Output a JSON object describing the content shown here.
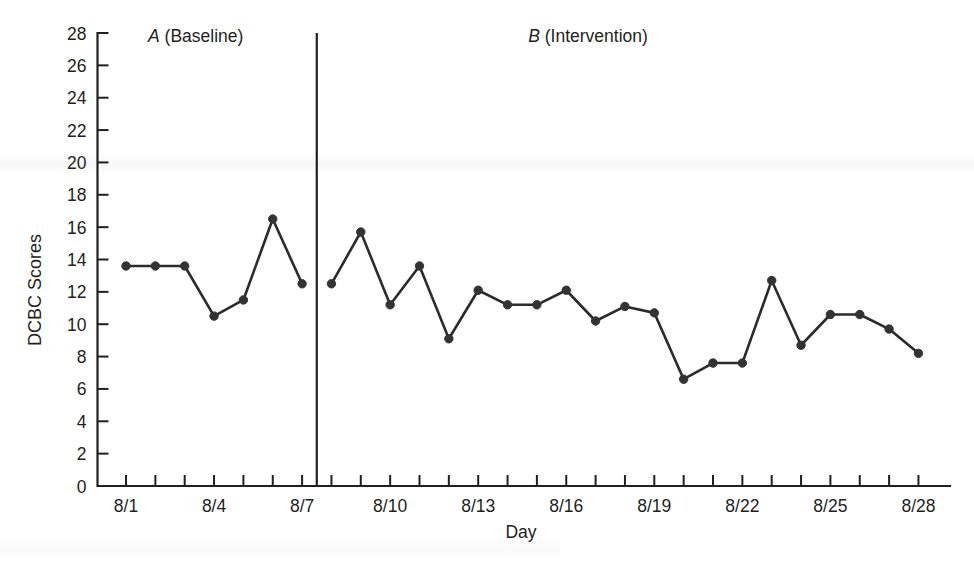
{
  "chart_data": {
    "type": "line",
    "title": "",
    "xlabel": "Day",
    "ylabel": "DCBC Scores",
    "ylim": [
      0,
      28
    ],
    "ytick_step": 2,
    "ytick_labels": [
      "0",
      "2",
      "4",
      "6",
      "8",
      "10",
      "12",
      "14",
      "16",
      "18",
      "20",
      "22",
      "24",
      "26",
      "28"
    ],
    "xtick_labels": [
      "8/1",
      "8/4",
      "8/7",
      "8/10",
      "8/13",
      "8/16",
      "8/19",
      "8/22",
      "8/25",
      "8/28"
    ],
    "xtick_label_every": 3,
    "grid": false,
    "legend": "none",
    "x": [
      "8/1",
      "8/2",
      "8/3",
      "8/4",
      "8/5",
      "8/6",
      "8/7",
      "8/8",
      "8/9",
      "8/10",
      "8/11",
      "8/12",
      "8/13",
      "8/14",
      "8/15",
      "8/16",
      "8/17",
      "8/18",
      "8/19",
      "8/20",
      "8/21",
      "8/22",
      "8/23",
      "8/24",
      "8/25",
      "8/26",
      "8/27",
      "8/28"
    ],
    "series": [
      {
        "name": "A (Baseline)",
        "phase": "baseline",
        "x": [
          "8/1",
          "8/2",
          "8/3",
          "8/4",
          "8/5",
          "8/6",
          "8/7"
        ],
        "values": [
          13.6,
          13.6,
          13.6,
          10.5,
          11.5,
          16.5,
          12.5
        ]
      },
      {
        "name": "B (Intervention)",
        "phase": "intervention",
        "x": [
          "8/8",
          "8/9",
          "8/10",
          "8/11",
          "8/12",
          "8/13",
          "8/14",
          "8/15",
          "8/16",
          "8/17",
          "8/18",
          "8/19",
          "8/20",
          "8/21",
          "8/22",
          "8/23",
          "8/24",
          "8/25",
          "8/26",
          "8/27",
          "8/28"
        ],
        "values": [
          12.5,
          15.7,
          11.2,
          13.6,
          9.1,
          12.1,
          11.2,
          11.2,
          12.1,
          10.2,
          11.1,
          10.7,
          6.6,
          7.6,
          7.6,
          12.7,
          8.7,
          10.6,
          10.6,
          9.7,
          8.2
        ]
      }
    ],
    "annotations": [
      {
        "name": "phase-label-a",
        "letter": "A",
        "text": " (Baseline)",
        "x": "8/2",
        "y": 28
      },
      {
        "name": "phase-label-b",
        "letter": "B",
        "text": " (Intervention)",
        "x": "8/17",
        "y": 28
      }
    ],
    "phase_change_line": {
      "between": [
        "8/7",
        "8/8"
      ]
    },
    "colors": {
      "line": "#2b2b2b",
      "marker": "#333333",
      "axis": "#231f20",
      "background": "#ffffff"
    }
  },
  "axis": {
    "y_label": "DCBC Scores",
    "x_label": "Day"
  },
  "phase_a": {
    "letter": "A",
    "label": " (Baseline)"
  },
  "phase_b": {
    "letter": "B",
    "label": " (Intervention)"
  }
}
